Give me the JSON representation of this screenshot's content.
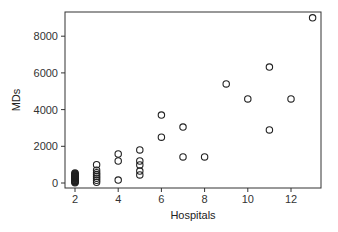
{
  "chart_data": {
    "type": "scatter",
    "title": "",
    "xlabel": "Hospitals",
    "ylabel": "MDs",
    "xlim": [
      1.55,
      13.5
    ],
    "ylim": [
      -280,
      9300
    ],
    "xticks": [
      2,
      4,
      6,
      8,
      10,
      12
    ],
    "yticks": [
      0,
      2000,
      4000,
      6000,
      8000
    ],
    "grid": false,
    "legend": null,
    "marker": "open-circle",
    "points": [
      {
        "x": 2,
        "y": 20
      },
      {
        "x": 2,
        "y": 50
      },
      {
        "x": 2,
        "y": 80
      },
      {
        "x": 2,
        "y": 110
      },
      {
        "x": 2,
        "y": 140
      },
      {
        "x": 2,
        "y": 170
      },
      {
        "x": 2,
        "y": 200
      },
      {
        "x": 2,
        "y": 230
      },
      {
        "x": 2,
        "y": 260
      },
      {
        "x": 2,
        "y": 290
      },
      {
        "x": 2,
        "y": 320
      },
      {
        "x": 2,
        "y": 350
      },
      {
        "x": 2,
        "y": 380
      },
      {
        "x": 2,
        "y": 410
      },
      {
        "x": 2,
        "y": 440
      },
      {
        "x": 2,
        "y": 470
      },
      {
        "x": 2,
        "y": 500
      },
      {
        "x": 2,
        "y": 540
      },
      {
        "x": 3,
        "y": 40
      },
      {
        "x": 3,
        "y": 150
      },
      {
        "x": 3,
        "y": 260
      },
      {
        "x": 3,
        "y": 360
      },
      {
        "x": 3,
        "y": 460
      },
      {
        "x": 3,
        "y": 560
      },
      {
        "x": 3,
        "y": 700
      },
      {
        "x": 3,
        "y": 1000
      },
      {
        "x": 4,
        "y": 160
      },
      {
        "x": 4,
        "y": 1200
      },
      {
        "x": 4,
        "y": 1580
      },
      {
        "x": 5,
        "y": 440
      },
      {
        "x": 5,
        "y": 650
      },
      {
        "x": 5,
        "y": 980
      },
      {
        "x": 5,
        "y": 1200
      },
      {
        "x": 5,
        "y": 1800
      },
      {
        "x": 6,
        "y": 2500
      },
      {
        "x": 6,
        "y": 3700
      },
      {
        "x": 7,
        "y": 1420
      },
      {
        "x": 7,
        "y": 3050
      },
      {
        "x": 8,
        "y": 1420
      },
      {
        "x": 9,
        "y": 5400
      },
      {
        "x": 10,
        "y": 4580
      },
      {
        "x": 11,
        "y": 2890
      },
      {
        "x": 11,
        "y": 6320
      },
      {
        "x": 12,
        "y": 4580
      },
      {
        "x": 13,
        "y": 9000
      }
    ]
  },
  "layout": {
    "plot_box": {
      "left": 65,
      "top": 12,
      "right": 321,
      "bottom": 188
    },
    "x_origin_px": 75,
    "x_px_per_unit": 21.6,
    "y_origin_px": 183,
    "y_px_per_unit": 0.01835,
    "colors": {
      "axis": "#333333",
      "marker": "#222222",
      "background": "#ffffff"
    }
  }
}
